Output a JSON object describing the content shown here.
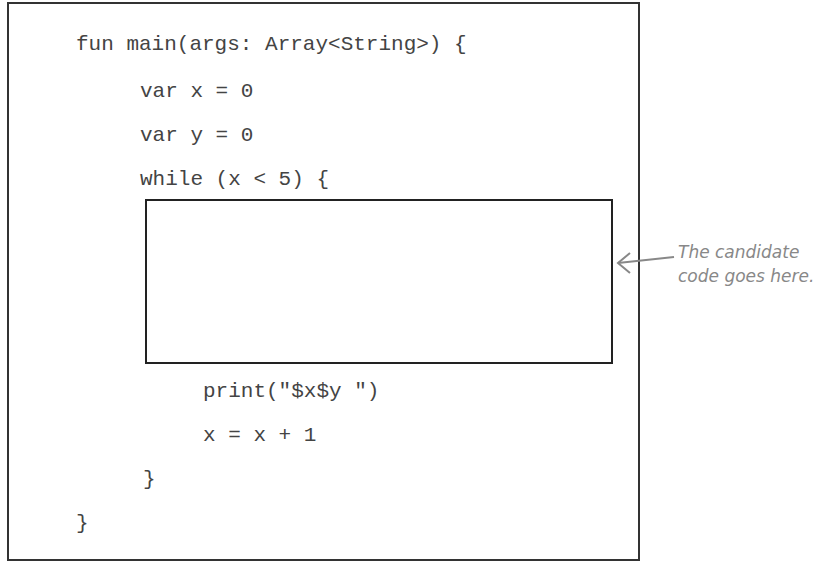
{
  "code": {
    "lines": [
      "fun main(args: Array<String>) {",
      "var x = 0",
      "var y = 0",
      "while (x < 5) {",
      "print(\"$x$y \")",
      "x = x + 1",
      "}",
      "}"
    ]
  },
  "annotation": {
    "line1": "The candidate",
    "line2": "code goes here."
  },
  "colors": {
    "border": "#333333",
    "code_text": "#444444",
    "annotation": "#888888"
  }
}
